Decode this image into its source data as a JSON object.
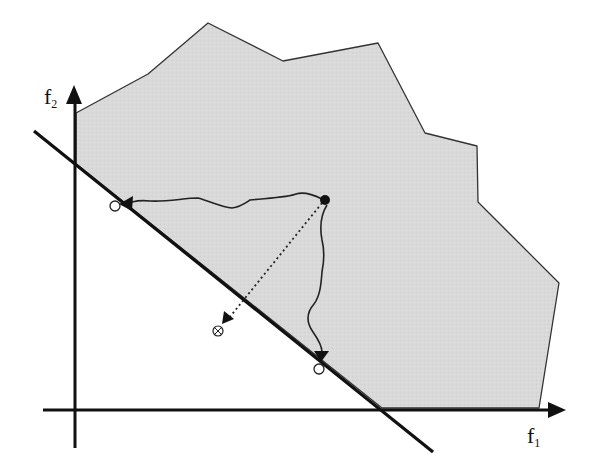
{
  "diagram": {
    "type": "multi-objective feasible region with aggregation line",
    "axes": {
      "x_label": "f",
      "x_label_sub": "1",
      "y_label": "f",
      "y_label_sub": "2"
    },
    "colors": {
      "region_fill": "#d9d9d9",
      "region_stroke": "#333333",
      "axis": "#111111",
      "line": "#111111",
      "path": "#222222",
      "background": "#ffffff"
    },
    "feasible_region": {
      "points": "76,113 148,74 208,23 283,61 378,43 425,133 477,146 478,202 559,283 539,408 382,408 76,164"
    },
    "separating_line": {
      "x1": 34,
      "y1": 131,
      "x2": 433,
      "y2": 452
    },
    "start_point": {
      "cx": 325,
      "cy": 200,
      "r": 5,
      "style": "filled"
    },
    "end_points": [
      {
        "name": "endpoint-left",
        "cx": 115,
        "cy": 206,
        "r": 5,
        "style": "open"
      },
      {
        "name": "endpoint-bottom",
        "cx": 319,
        "cy": 369,
        "r": 5,
        "style": "open"
      }
    ],
    "projection_target": {
      "cx": 218,
      "cy": 331,
      "r": 5,
      "style": "crossed-circle"
    },
    "paths": {
      "left_path": "M322,199 C312,194 302,192 296,194 C290,197 270,198 250,200 C244,204 240,207 232,208 C222,207 212,202 198,198 C184,198 168,202 150,201 C142,200 136,201 132,202",
      "down_path": "M327,205 C322,213 319,224 322,240 C325,252 324,262 322,272 C321,285 320,296 314,304 C307,312 306,322 313,332 C320,342 322,348 322,352",
      "dotted_projection": "M322,203 L229,318"
    }
  }
}
